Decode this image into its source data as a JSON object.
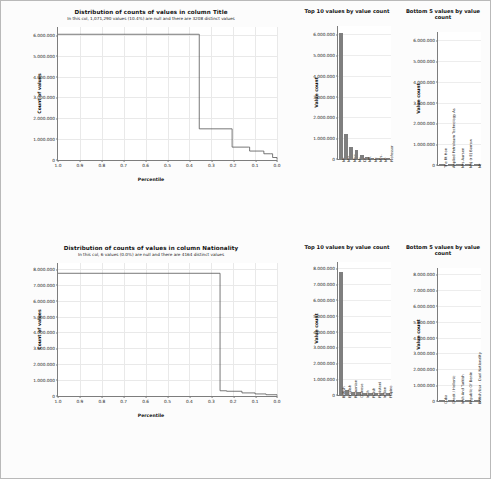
{
  "figure": {
    "background": "#fcfcfc",
    "bar_color": "#7f7f7f",
    "line_color": "#555555",
    "grid_color": "#e9e9e9"
  },
  "chart_data": [
    {
      "type": "line",
      "panel": "distribution-title",
      "title": "Distribution of counts of values in column Title",
      "subtitle": "In this col, 1,071,290 values (10.4%) are null and there are 3208 distinct values",
      "xlabel": "Percentile",
      "ylabel": "Count of values",
      "xlim": [
        1.0,
        0.0
      ],
      "ylim": [
        0,
        6400000
      ],
      "xticks": [
        "1.0",
        "0.9",
        "0.8",
        "0.7",
        "0.6",
        "0.5",
        "0.4",
        "0.3",
        "0.2",
        "0.1",
        "0.0"
      ],
      "yticks": [
        "0",
        "1.000.000",
        "2.000.000",
        "3.000.000",
        "4.000.000",
        "5.000.000",
        "6.000.000"
      ],
      "ytick_values": [
        0,
        1000000,
        2000000,
        3000000,
        4000000,
        5000000,
        6000000
      ],
      "grid": true,
      "points": [
        {
          "x": 1.0,
          "y": 6050000
        },
        {
          "x": 0.36,
          "y": 6050000
        },
        {
          "x": 0.355,
          "y": 1500000
        },
        {
          "x": 0.21,
          "y": 1500000
        },
        {
          "x": 0.205,
          "y": 620000
        },
        {
          "x": 0.13,
          "y": 620000
        },
        {
          "x": 0.125,
          "y": 430000
        },
        {
          "x": 0.065,
          "y": 430000
        },
        {
          "x": 0.06,
          "y": 300000
        },
        {
          "x": 0.03,
          "y": 300000
        },
        {
          "x": 0.02,
          "y": 120000
        },
        {
          "x": 0.0,
          "y": 20000
        }
      ]
    },
    {
      "type": "bar",
      "panel": "top10-title",
      "title": "Top 10 values by value count",
      "ylabel": "Value count",
      "ylim": [
        0,
        6400000
      ],
      "yticks": [
        "0",
        "1.000.000",
        "2.000.000",
        "3.000.000",
        "4.000.000",
        "5.000.000",
        "6.000.000"
      ],
      "ytick_values": [
        0,
        1000000,
        2000000,
        3000000,
        4000000,
        5000000,
        6000000
      ],
      "categories": [
        "Mr",
        "Mrs",
        "Miss",
        "Ms",
        "Dr",
        "MR",
        "Mr.",
        "Mrs.",
        "Mr",
        "Professor"
      ],
      "values": [
        6050000,
        1180000,
        570000,
        430000,
        180000,
        95000,
        60000,
        45000,
        35000,
        25000
      ]
    },
    {
      "type": "bar",
      "panel": "bottom5-title",
      "title": "Bottom 5 values by value count",
      "ylabel": "Value count",
      "ylim": [
        0,
        6400000
      ],
      "yticks": [
        "0",
        "1.000.000",
        "2.000.000",
        "3.000.000",
        "4.000.000",
        "5.000.000",
        "6.000.000"
      ],
      "ytick_values": [
        0,
        1000000,
        2000000,
        3000000,
        4000000,
        5000000,
        6000000
      ],
      "categories": [
        "The Rt Hon",
        "Applied Petroleum Technology As",
        "Mrs Aursen",
        "Maj (r E) Barrow",
        "Mr"
      ],
      "values": [
        1,
        1,
        1,
        1,
        1
      ]
    },
    {
      "type": "line",
      "panel": "distribution-nationality",
      "title": "Distribution of counts of values in column Nationality",
      "subtitle": "In this col, 6 values (0.0%) are null and there are 4164 distinct values",
      "xlabel": "Percentile",
      "ylabel": "Count of values",
      "xlim": [
        1.0,
        0.0
      ],
      "ylim": [
        0,
        8400000
      ],
      "xticks": [
        "1.0",
        "0.9",
        "0.8",
        "0.7",
        "0.6",
        "0.5",
        "0.4",
        "0.3",
        "0.2",
        "0.1",
        "0.0"
      ],
      "yticks": [
        "0",
        "1.000.000",
        "2.000.000",
        "3.000.000",
        "4.000.000",
        "5.000.000",
        "6.000.000",
        "7.000.000",
        "8.000.000"
      ],
      "ytick_values": [
        0,
        1000000,
        2000000,
        3000000,
        4000000,
        5000000,
        6000000,
        7000000,
        8000000
      ],
      "grid": true,
      "points": [
        {
          "x": 1.0,
          "y": 7750000
        },
        {
          "x": 0.265,
          "y": 7750000
        },
        {
          "x": 0.26,
          "y": 330000
        },
        {
          "x": 0.23,
          "y": 300000
        },
        {
          "x": 0.16,
          "y": 195000
        },
        {
          "x": 0.1,
          "y": 130000
        },
        {
          "x": 0.05,
          "y": 80000
        },
        {
          "x": 0.0,
          "y": 20000
        }
      ]
    },
    {
      "type": "bar",
      "panel": "top10-nationality",
      "title": "Top 10 values by value count",
      "ylabel": "Value count",
      "ylim": [
        0,
        8400000
      ],
      "yticks": [
        "0",
        "1.000.000",
        "2.000.000",
        "3.000.000",
        "4.000.000",
        "5.000.000",
        "6.000.000",
        "7.000.000",
        "8.000.000"
      ],
      "ytick_values": [
        0,
        1000000,
        2000000,
        3000000,
        4000000,
        5000000,
        6000000,
        7000000,
        8000000
      ],
      "categories": [
        "British",
        "English",
        "Romanian",
        "Chinese",
        "Irish",
        "Polish",
        "Pakistani",
        "Indian",
        "Filipino"
      ],
      "values": [
        7750000,
        330000,
        200000,
        160000,
        140000,
        130000,
        120000,
        105000,
        95000
      ]
    },
    {
      "type": "bar",
      "panel": "bottom5-nationality",
      "title": "Bottom 5 values by value count",
      "ylabel": "Value count",
      "ylim": [
        0,
        8400000
      ],
      "yticks": [
        "0",
        "1.000.000",
        "2.000.000",
        "3.000.000",
        "4.000.000",
        "5.000.000",
        "6.000.000",
        "7.000.000",
        "8.000.000"
      ],
      "ytick_values": [
        0,
        1000000,
        2000000,
        3000000,
        4000000,
        5000000,
        6000000,
        7000000,
        8000000
      ],
      "categories": [
        "Cuba",
        "Greek / Hellenic",
        "Irish And Turkish",
        "Republic Of Benin",
        "British/Usa - Dual Nationality"
      ],
      "values": [
        1,
        1,
        1,
        1,
        1
      ]
    }
  ]
}
